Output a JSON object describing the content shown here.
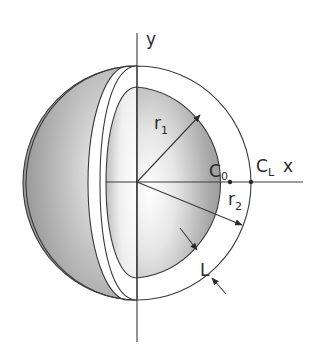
{
  "figure": {
    "axes": {
      "x_label": "x",
      "y_label": "y"
    },
    "labels": {
      "inner_radius": {
        "base": "r",
        "sub": "1"
      },
      "outer_radius": {
        "base": "r",
        "sub": "2"
      },
      "inner_concentration": {
        "base": "C",
        "sub": "0"
      },
      "outer_concentration": {
        "base": "C",
        "sub": "L"
      },
      "thickness": "L"
    },
    "colors": {
      "line": "#3a3a3a",
      "shade_dark": "#9a9a9a",
      "shade_light": "#f2f2f2",
      "shell": "#ffffff"
    }
  }
}
